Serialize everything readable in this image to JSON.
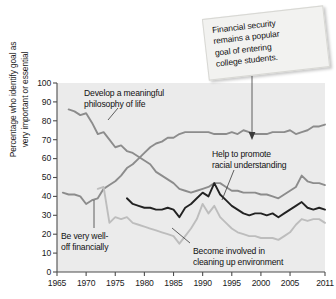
{
  "chart_data": {
    "type": "line",
    "title": "",
    "xlabel": "",
    "ylabel": "Percentage who identify goal as very important or essential",
    "ylabel_line1": "Percentage who identify goal as",
    "ylabel_line2": "very important or essential",
    "xlim": [
      1965,
      2011
    ],
    "ylim": [
      0,
      100
    ],
    "grid": false,
    "legend_position": "inline-annotations",
    "yticks": [
      0,
      10,
      20,
      30,
      40,
      50,
      60,
      70,
      80,
      90,
      100
    ],
    "xticks": [
      1965,
      1970,
      1975,
      1980,
      1985,
      1990,
      1995,
      2000,
      2005,
      2011
    ],
    "series": [
      {
        "name": "Be very well-off financially",
        "color": "#8c8c8c",
        "x": [
          1966,
          1967,
          1968,
          1969,
          1970,
          1971,
          1972,
          1973,
          1974,
          1975,
          1976,
          1977,
          1978,
          1979,
          1980,
          1981,
          1982,
          1983,
          1984,
          1985,
          1986,
          1987,
          1988,
          1989,
          1990,
          1991,
          1992,
          1993,
          1994,
          1995,
          1996,
          1997,
          1998,
          1999,
          2000,
          2001,
          2002,
          2003,
          2004,
          2005,
          2006,
          2007,
          2008,
          2009,
          2010,
          2011
        ],
        "y": [
          42,
          41,
          41,
          40,
          36,
          38,
          39,
          44,
          46,
          48,
          51,
          55,
          57,
          60,
          63,
          66,
          68,
          69,
          71,
          71,
          73,
          74,
          74,
          74,
          74,
          74,
          73,
          73,
          73,
          74,
          73,
          75,
          74,
          73,
          73,
          73,
          74,
          74,
          74,
          75,
          73,
          74,
          75,
          77,
          77,
          78
        ]
      },
      {
        "name": "Develop a meaningful philosophy of life",
        "color": "#8c8c8c",
        "x": [
          1967,
          1968,
          1969,
          1970,
          1971,
          1972,
          1973,
          1974,
          1975,
          1976,
          1977,
          1978,
          1979,
          1980,
          1981,
          1982,
          1983,
          1984,
          1985,
          1986,
          1987,
          1988,
          1989,
          1990,
          1991,
          1992,
          1993,
          1994,
          1995,
          1996,
          1997,
          1998,
          1999,
          2000,
          2001,
          2002,
          2003,
          2004,
          2005,
          2006,
          2007,
          2008,
          2009,
          2010,
          2011
        ],
        "y": [
          86,
          85,
          83,
          84,
          79,
          73,
          74,
          70,
          66,
          67,
          64,
          63,
          61,
          59,
          57,
          53,
          51,
          49,
          47,
          44,
          43,
          42,
          43,
          44,
          45,
          47,
          47,
          45,
          43,
          43,
          42,
          42,
          42,
          41,
          41,
          40,
          39,
          41,
          43,
          45,
          51,
          48,
          47,
          47,
          46
        ]
      },
      {
        "name": "Help to promote racial understanding",
        "color": "#222222",
        "x": [
          1977,
          1978,
          1979,
          1980,
          1981,
          1982,
          1983,
          1984,
          1985,
          1986,
          1987,
          1988,
          1989,
          1990,
          1991,
          1992,
          1993,
          1994,
          1995,
          1996,
          1997,
          1998,
          1999,
          2000,
          2001,
          2002,
          2003,
          2004,
          2005,
          2006,
          2007,
          2008,
          2009,
          2010,
          2011
        ],
        "y": [
          39,
          36,
          35,
          34,
          34,
          33,
          33,
          34,
          33,
          29,
          34,
          36,
          39,
          42,
          40,
          47,
          41,
          38,
          35,
          33,
          31,
          30,
          31,
          31,
          30,
          31,
          29,
          31,
          33,
          35,
          37,
          34,
          33,
          34,
          33
        ]
      },
      {
        "name": "Become involved in cleaning up environment",
        "color": "#bdbdbd",
        "x": [
          1972,
          1973,
          1974,
          1975,
          1976,
          1977,
          1978,
          1979,
          1980,
          1981,
          1982,
          1983,
          1984,
          1985,
          1986,
          1987,
          1988,
          1989,
          1990,
          1991,
          1992,
          1993,
          1994,
          1995,
          1996,
          1997,
          1998,
          1999,
          2000,
          2001,
          2002,
          2003,
          2004,
          2005,
          2006,
          2007,
          2008,
          2009,
          2010,
          2011
        ],
        "y": [
          44,
          45,
          26,
          29,
          28,
          29,
          26,
          25,
          24,
          23,
          22,
          21,
          20,
          19,
          15,
          19,
          23,
          28,
          36,
          31,
          35,
          29,
          26,
          23,
          21,
          20,
          19,
          19,
          18,
          18,
          18,
          17,
          19,
          21,
          25,
          28,
          27,
          28,
          28,
          26
        ]
      }
    ],
    "annotations": [
      {
        "id": "philosophy-label",
        "text_line1": "Develop a meaningful",
        "text_line2": "philosophy of life"
      },
      {
        "id": "racial-label",
        "text_line1": "Help to promote",
        "text_line2": "racial understanding"
      },
      {
        "id": "financial-label",
        "text_line1": "Be very well-",
        "text_line2": "off financially"
      },
      {
        "id": "environment-label",
        "text_line1": "Become involved in",
        "text_line2": "cleaning up environment"
      }
    ],
    "callout": {
      "line1": "Financial security",
      "line2": "remains a popular",
      "line3": "goal of entering",
      "line4": "college students."
    }
  }
}
